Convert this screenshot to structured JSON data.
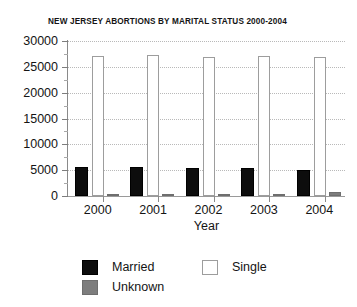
{
  "chart_data": {
    "type": "bar",
    "title": "NEW JERSEY ABORTIONS BY MARITAL STATUS 2000-2004",
    "xlabel": "Year",
    "ylabel": "",
    "categories": [
      "2000",
      "2001",
      "2002",
      "2003",
      "2004"
    ],
    "series": [
      {
        "name": "Married",
        "color": "#0d0d0d",
        "values": [
          5700,
          5700,
          5500,
          5400,
          5100
        ]
      },
      {
        "name": "Single",
        "color": "#ffffff",
        "values": [
          27100,
          27300,
          27000,
          27100,
          27000
        ]
      },
      {
        "name": "Unknown",
        "color": "#7d7d7d",
        "values": [
          250,
          180,
          300,
          450,
          700
        ]
      }
    ],
    "ylim": [
      0,
      30000
    ],
    "yticks": [
      0,
      5000,
      10000,
      15000,
      20000,
      25000,
      30000
    ],
    "ytick_labels": [
      "0",
      "5000",
      "10000",
      "15000",
      "20000",
      "25000",
      "30000"
    ],
    "minor_yticks": [
      2500,
      7500,
      12500,
      17500,
      22500,
      27500
    ],
    "grid": true,
    "grid_style": "dotted",
    "legend_position": "bottom-left",
    "legend": [
      {
        "label": "Married",
        "swatch": "sw-married"
      },
      {
        "label": "Single",
        "swatch": "sw-single"
      },
      {
        "label": "Unknown",
        "swatch": "sw-unknown"
      }
    ]
  }
}
